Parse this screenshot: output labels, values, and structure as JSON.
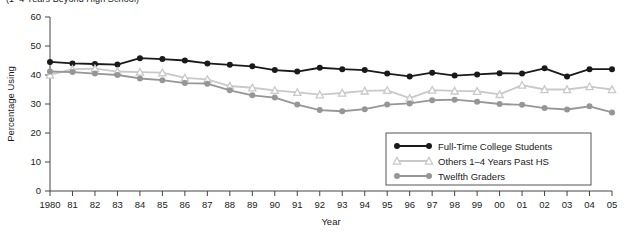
{
  "title": "(1–4 Years Beyond High School)",
  "axes": {
    "ylabel": "Percentage Using",
    "xlabel": "Year",
    "yticks": [
      "0",
      "10",
      "20",
      "30",
      "40",
      "50",
      "60"
    ],
    "xticks": [
      "1980",
      "81",
      "82",
      "83",
      "84",
      "85",
      "86",
      "87",
      "88",
      "89",
      "90",
      "91",
      "92",
      "93",
      "94",
      "95",
      "96",
      "97",
      "98",
      "99",
      "00",
      "01",
      "02",
      "03",
      "04",
      "05"
    ]
  },
  "legend": {
    "items": [
      {
        "label": "Full-Time College Students",
        "color": "#1a1a1a",
        "marker": "circle"
      },
      {
        "label": "Others 1–4 Years Past HS",
        "color": "#c9c9c9",
        "marker": "triangle"
      },
      {
        "label": "Twelfth Graders",
        "color": "#969696",
        "marker": "circle"
      }
    ]
  },
  "chart_data": {
    "type": "line",
    "title": "(1–4 Years Beyond High School)",
    "xlabel": "Year",
    "ylabel": "Percentage Using",
    "ylim": [
      0,
      60
    ],
    "grid": false,
    "legend_position": "bottom-right",
    "categories": [
      "1980",
      "81",
      "82",
      "83",
      "84",
      "85",
      "86",
      "87",
      "88",
      "89",
      "90",
      "91",
      "92",
      "93",
      "94",
      "95",
      "96",
      "97",
      "98",
      "99",
      "00",
      "01",
      "02",
      "03",
      "04",
      "05"
    ],
    "x": [
      1980,
      1981,
      1982,
      1983,
      1984,
      1985,
      1986,
      1987,
      1988,
      1989,
      1990,
      1991,
      1992,
      1993,
      1994,
      1995,
      1996,
      1997,
      1998,
      1999,
      2000,
      2001,
      2002,
      2003,
      2004,
      2005
    ],
    "series": [
      {
        "name": "Full-Time College Students",
        "color": "#1a1a1a",
        "marker": "circle",
        "values": [
          44.5,
          44.0,
          43.8,
          43.6,
          45.8,
          45.5,
          45.0,
          44.0,
          43.5,
          43.0,
          41.7,
          41.2,
          42.5,
          42.0,
          41.7,
          40.5,
          39.5,
          40.8,
          39.8,
          40.2,
          40.6,
          40.5,
          42.3,
          39.5,
          42.0,
          42.0
        ]
      },
      {
        "name": "Others 1–4 Years Past HS",
        "color": "#c9c9c9",
        "marker": "triangle",
        "values": [
          40.0,
          42.0,
          42.2,
          41.2,
          41.0,
          40.8,
          39.0,
          38.5,
          36.2,
          35.6,
          34.7,
          34.0,
          33.2,
          33.8,
          34.5,
          34.7,
          32.0,
          34.8,
          34.5,
          34.4,
          33.3,
          36.5,
          35.0,
          35.0,
          36.0,
          35.0
        ]
      },
      {
        "name": "Twelfth Graders",
        "color": "#969696",
        "marker": "circle",
        "values": [
          41.2,
          41.0,
          40.5,
          40.0,
          38.8,
          38.2,
          37.2,
          37.0,
          34.7,
          33.0,
          32.2,
          29.8,
          27.9,
          27.5,
          28.2,
          29.8,
          30.2,
          31.3,
          31.5,
          30.8,
          30.0,
          29.7,
          28.6,
          28.1,
          29.2,
          27.1
        ]
      }
    ]
  }
}
